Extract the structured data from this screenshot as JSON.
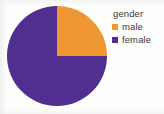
{
  "chart_data": {
    "type": "pie",
    "title": "gender",
    "categories": [
      "male",
      "female"
    ],
    "values": [
      25,
      75
    ],
    "value_unit": "percent",
    "colors": [
      "#ef9733",
      "#512f90"
    ],
    "legend_position": "right",
    "grid": false,
    "xlabel": "",
    "ylabel": "",
    "start_angle_deg": 0,
    "direction": "clockwise",
    "slices": [
      {
        "label": "male",
        "value": 25,
        "color": "#ef9733",
        "start_deg": 0,
        "end_deg": 90
      },
      {
        "label": "female",
        "value": 75,
        "color": "#512f90",
        "start_deg": 90,
        "end_deg": 360
      }
    ]
  },
  "legend": {
    "title": "gender",
    "items": [
      {
        "label": "male",
        "color": "#ef9733",
        "swatch_name": "legend-swatch-male"
      },
      {
        "label": "female",
        "color": "#512f90",
        "swatch_name": "legend-swatch-female"
      }
    ]
  },
  "figure": {
    "background": "#fdfdfb"
  }
}
